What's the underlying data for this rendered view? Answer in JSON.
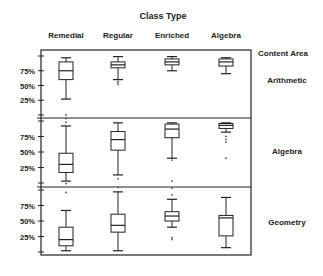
{
  "chart_data": {
    "type": "boxplot",
    "title": "Class Type",
    "row_header": "Content Area",
    "categories": [
      "Remedial",
      "Regular",
      "Enriched",
      "Algebra"
    ],
    "y_ticks": [
      "25%",
      "50%",
      "75%"
    ],
    "ylim": [
      0,
      100
    ],
    "grid": false,
    "panels": [
      {
        "name": "Arithmetic",
        "boxes": [
          {
            "category": "Remedial",
            "min": 27,
            "q1": 60,
            "median": 75,
            "q3": 90,
            "max": 97,
            "outliers": [
              0
            ]
          },
          {
            "category": "Regular",
            "min": 60,
            "q1": 80,
            "median": 85,
            "q3": 90,
            "max": 99,
            "outliers": [
              57,
              55,
              52
            ]
          },
          {
            "category": "Enriched",
            "min": 75,
            "q1": 85,
            "median": 90,
            "q3": 95,
            "max": 99,
            "outliers": []
          },
          {
            "category": "Algebra",
            "min": 70,
            "q1": 83,
            "median": 90,
            "q3": 95,
            "max": 97,
            "outliers": []
          }
        ]
      },
      {
        "name": "Algebra",
        "boxes": [
          {
            "category": "Remedial",
            "min": 3,
            "q1": 17,
            "median": 30,
            "q3": 48,
            "max": 92,
            "outliers": [
              104,
              98,
              -1
            ]
          },
          {
            "category": "Regular",
            "min": 13,
            "q1": 53,
            "median": 70,
            "q3": 83,
            "max": 97,
            "outliers": [
              7
            ]
          },
          {
            "category": "Enriched",
            "min": 40,
            "q1": 73,
            "median": 87,
            "q3": 95,
            "max": 97,
            "outliers": [
              37,
              3
            ]
          },
          {
            "category": "Algebra",
            "min": 82,
            "q1": 88,
            "median": 93,
            "q3": 96,
            "max": 97,
            "outliers": [
              75,
              70,
              66,
              40
            ]
          }
        ]
      },
      {
        "name": "Geometry",
        "boxes": [
          {
            "category": "Remedial",
            "min": 2,
            "q1": 10,
            "median": 20,
            "q3": 40,
            "max": 67,
            "outliers": [
              96
            ]
          },
          {
            "category": "Regular",
            "min": 2,
            "q1": 32,
            "median": 43,
            "q3": 61,
            "max": 97,
            "outliers": [
              104
            ]
          },
          {
            "category": "Enriched",
            "min": 40,
            "q1": 50,
            "median": 58,
            "q3": 65,
            "max": 85,
            "outliers": [
              103,
              92,
              23,
              20
            ]
          },
          {
            "category": "Algebra",
            "min": 7,
            "q1": 26,
            "median": 55,
            "q3": 59,
            "max": 88,
            "outliers": []
          }
        ]
      }
    ]
  },
  "layout": {
    "frame": {
      "left": 41,
      "right": 251,
      "top": 50,
      "bottom": 255
    },
    "dividers": [
      118,
      187
    ],
    "panel_scales": [
      {
        "y0": 115,
        "y100": 56
      },
      {
        "y0": 183,
        "y100": 121
      },
      {
        "y0": 252,
        "y100": 190
      }
    ],
    "box_x": [
      66,
      118,
      172,
      226
    ],
    "box_width": 14,
    "panel_label_y": [
      83,
      154,
      225
    ],
    "color": "#222222"
  }
}
